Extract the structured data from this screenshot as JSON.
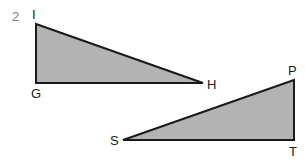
{
  "question_number": "2",
  "colors": {
    "fill": "#b3b3b3",
    "stroke": "#1a1a1a",
    "number": "#808080"
  },
  "triangles": [
    {
      "name": "GHI",
      "vertices": [
        {
          "label": "I",
          "x": 36,
          "y": 24
        },
        {
          "label": "G",
          "x": 36,
          "y": 83
        },
        {
          "label": "H",
          "x": 203,
          "y": 83
        }
      ],
      "right_angle_at": "G"
    },
    {
      "name": "PST",
      "vertices": [
        {
          "label": "P",
          "x": 294,
          "y": 80
        },
        {
          "label": "S",
          "x": 123,
          "y": 140
        },
        {
          "label": "T",
          "x": 294,
          "y": 140
        }
      ],
      "right_angle_at": "T"
    }
  ],
  "labels": {
    "I": "I",
    "G": "G",
    "H": "H",
    "P": "P",
    "S": "S",
    "T": "T"
  }
}
